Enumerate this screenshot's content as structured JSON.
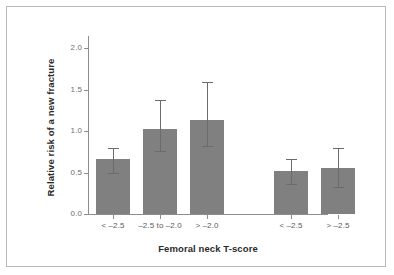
{
  "chart_data": {
    "type": "bar",
    "title": "",
    "xlabel": "Femoral neck T-score",
    "ylabel": "Relative risk of a new fracture",
    "categories": [
      "< –2.5",
      "–2.5 to –2.0",
      "> –2.0",
      "< –2.5",
      "> –2.5"
    ],
    "values": [
      0.66,
      1.03,
      1.14,
      0.52,
      0.56
    ],
    "errors_low": [
      0.5,
      0.76,
      0.82,
      0.36,
      0.33
    ],
    "errors_high": [
      0.8,
      1.38,
      1.6,
      0.67,
      0.8
    ],
    "ylim": [
      0.0,
      2.15
    ],
    "yticks": [
      0.0,
      0.5,
      1.0,
      1.5,
      2.0
    ],
    "ytick_labels": [
      "0.0",
      "0.5",
      "1.0",
      "1.5",
      "2.0"
    ],
    "grid": false,
    "legend": false,
    "bar_color": "#808080",
    "error_color": "#6b6b6b",
    "axis_color": "#8d8d8d",
    "group_gap_after_index": 2
  },
  "axes": {
    "y_title": "Relative risk of a new fracture",
    "x_title": "Femoral neck T-score"
  },
  "frame": {
    "border_color": "#b9b9b9",
    "background": "#ffffff"
  }
}
